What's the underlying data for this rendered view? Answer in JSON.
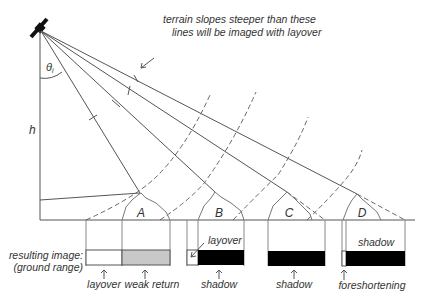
{
  "diagram": {
    "symbols": {
      "incidence_angle": "θ",
      "incidence_subscript": "i",
      "height": "h"
    },
    "annotation": {
      "line1": "terrain slopes steeper than these",
      "line2": "lines will be imaged with layover"
    },
    "hills": [
      {
        "label": "A"
      },
      {
        "label": "B"
      },
      {
        "label": "C"
      },
      {
        "label": "D"
      }
    ],
    "image_row": {
      "label_line1": "resulting image:",
      "label_line2": "(ground range)"
    },
    "inline_labels": {
      "b_layover": "layover",
      "d_shadow": "shadow"
    },
    "bottom_labels": [
      {
        "text": "layover"
      },
      {
        "text": "weak return"
      },
      {
        "text": "shadow"
      },
      {
        "text": "shadow"
      },
      {
        "text": "foreshortening"
      }
    ],
    "colors": {
      "line": "#555555",
      "text": "#333333",
      "shadow_fill": "#000000",
      "weak_return_fill": "#c8c8c8",
      "background": "#ffffff"
    }
  }
}
